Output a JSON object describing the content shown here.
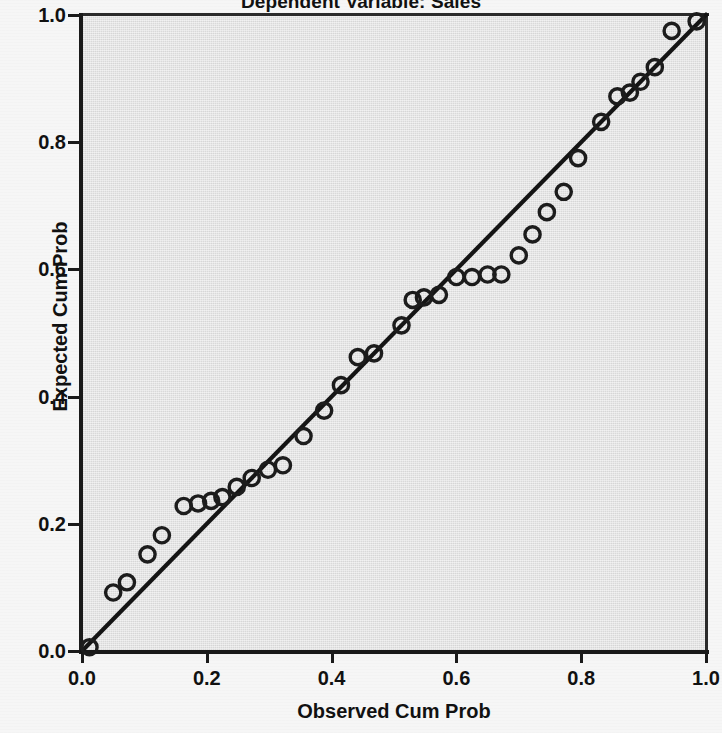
{
  "chart_data": {
    "type": "scatter",
    "title": "Dependent Variable: Sales",
    "subtitle": "",
    "xlabel": "Observed Cum Prob",
    "ylabel": "Expected Cum Prob",
    "xlim": [
      0.0,
      1.0
    ],
    "ylim": [
      0.0,
      1.0
    ],
    "xticks": [
      "0.0",
      "0.2",
      "0.4",
      "0.6",
      "0.8",
      "1.0"
    ],
    "xtick_values": [
      0.0,
      0.2,
      0.4,
      0.6,
      0.8,
      1.0
    ],
    "yticks": [
      "0.0",
      "0.2",
      "0.4",
      "0.6",
      "0.8",
      "1.0"
    ],
    "ytick_values": [
      0.0,
      0.2,
      0.4,
      0.6,
      0.8,
      1.0
    ],
    "grid": false,
    "legend": "none",
    "plot_background": "#d9d9d9",
    "figure_background": "#f6f6f6",
    "marker": "open-circle",
    "marker_color": "#1c1c1c",
    "reference_line": {
      "label": "diagonal reference line",
      "from": [
        0.0,
        0.0
      ],
      "to": [
        1.0,
        1.0
      ],
      "color": "#141414"
    },
    "series": [
      {
        "name": "Normal P-P Plot of Regression Standardized Residual",
        "points": [
          [
            0.012,
            0.006
          ],
          [
            0.05,
            0.092
          ],
          [
            0.072,
            0.108
          ],
          [
            0.105,
            0.152
          ],
          [
            0.128,
            0.182
          ],
          [
            0.163,
            0.228
          ],
          [
            0.186,
            0.232
          ],
          [
            0.207,
            0.236
          ],
          [
            0.225,
            0.242
          ],
          [
            0.248,
            0.258
          ],
          [
            0.272,
            0.272
          ],
          [
            0.298,
            0.285
          ],
          [
            0.322,
            0.292
          ],
          [
            0.355,
            0.338
          ],
          [
            0.388,
            0.378
          ],
          [
            0.415,
            0.418
          ],
          [
            0.442,
            0.462
          ],
          [
            0.468,
            0.468
          ],
          [
            0.512,
            0.512
          ],
          [
            0.53,
            0.552
          ],
          [
            0.548,
            0.556
          ],
          [
            0.572,
            0.56
          ],
          [
            0.6,
            0.588
          ],
          [
            0.625,
            0.588
          ],
          [
            0.65,
            0.592
          ],
          [
            0.672,
            0.592
          ],
          [
            0.7,
            0.622
          ],
          [
            0.722,
            0.655
          ],
          [
            0.745,
            0.69
          ],
          [
            0.772,
            0.722
          ],
          [
            0.795,
            0.775
          ],
          [
            0.832,
            0.832
          ],
          [
            0.858,
            0.872
          ],
          [
            0.878,
            0.878
          ],
          [
            0.895,
            0.895
          ],
          [
            0.918,
            0.918
          ],
          [
            0.945,
            0.975
          ],
          [
            0.985,
            0.99
          ]
        ]
      }
    ]
  }
}
